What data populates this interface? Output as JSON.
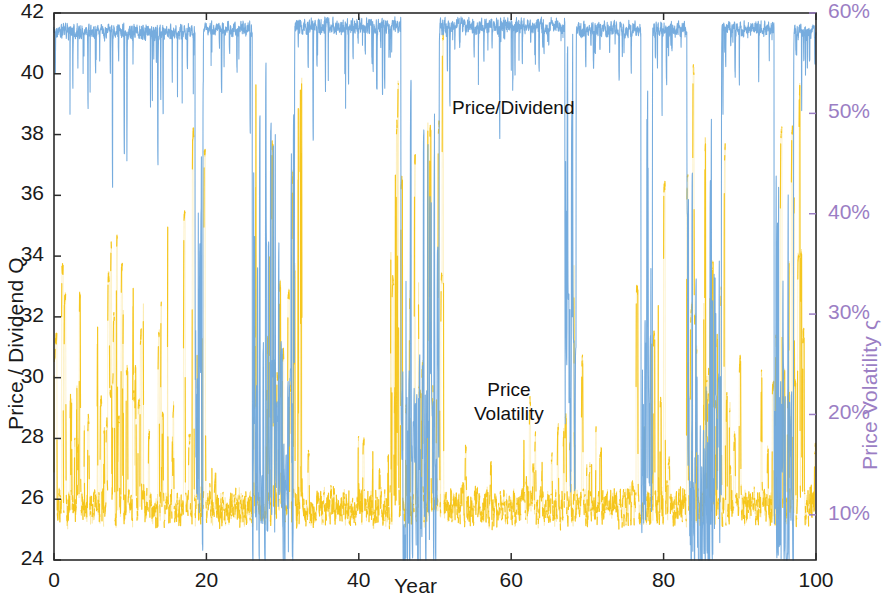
{
  "chart_data": {
    "type": "line",
    "title": "",
    "xlabel": "Year",
    "ylabel": "Price / Dividend Q",
    "ylabel_right": "Price Volatility ς",
    "xlim": [
      0,
      100
    ],
    "ylim": [
      24,
      42
    ],
    "ylim_right": [
      0.055,
      0.6
    ],
    "grid": false,
    "legend": "inline-annotations",
    "xticks": [
      0,
      20,
      40,
      60,
      80,
      100
    ],
    "xticklabels": [
      "0",
      "20",
      "40",
      "60",
      "80",
      "100"
    ],
    "yticks": [
      24,
      26,
      28,
      30,
      32,
      34,
      36,
      38,
      40,
      42
    ],
    "yticklabels": [
      "24",
      "26",
      "28",
      "30",
      "32",
      "34",
      "36",
      "38",
      "40",
      "42"
    ],
    "yticks_right": [
      0.1,
      0.2,
      0.3,
      0.4,
      0.5,
      0.6
    ],
    "yticklabels_right": [
      "10%",
      "20%",
      "30%",
      "40%",
      "50%",
      "60%"
    ],
    "series": [
      {
        "name": "Price/Dividend",
        "axis": "left",
        "color": "#6FA8DC",
        "style": "solid",
        "linewidth": 1,
        "description": "Regime-switching price/dividend ratio Q. Sits near the 41-42 ceiling during calm regimes with frequent sharp downward spikes, and collapses into the 24-30 band during crash regimes.",
        "regimes": [
          {
            "x_start": 0.0,
            "x_end": 18.5,
            "state": "high",
            "level": 41.6,
            "spike_depth_min": 37.5,
            "spike_depth_max": 40.5
          },
          {
            "x_start": 18.5,
            "x_end": 19.5,
            "state": "crash",
            "level": 28.0
          },
          {
            "x_start": 19.5,
            "x_end": 26.0,
            "state": "high",
            "level": 41.7,
            "spike_depth_min": 39.5,
            "spike_depth_max": 41.0
          },
          {
            "x_start": 26.0,
            "x_end": 31.5,
            "state": "crash",
            "level": 27.5
          },
          {
            "x_start": 31.5,
            "x_end": 45.5,
            "state": "high",
            "level": 41.8,
            "spike_depth_min": 38.5,
            "spike_depth_max": 41.0
          },
          {
            "x_start": 45.5,
            "x_end": 50.5,
            "state": "crash",
            "level": 27.0
          },
          {
            "x_start": 50.5,
            "x_end": 67.0,
            "state": "high",
            "level": 41.8,
            "spike_depth_min": 39.0,
            "spike_depth_max": 41.2
          },
          {
            "x_start": 67.0,
            "x_end": 68.5,
            "state": "crash",
            "level": 29.0
          },
          {
            "x_start": 68.5,
            "x_end": 77.0,
            "state": "high",
            "level": 41.7,
            "spike_depth_min": 38.8,
            "spike_depth_max": 41.0
          },
          {
            "x_start": 77.0,
            "x_end": 78.5,
            "state": "crash",
            "level": 28.5
          },
          {
            "x_start": 78.5,
            "x_end": 83.0,
            "state": "high",
            "level": 41.7,
            "spike_depth_min": 39.5,
            "spike_depth_max": 41.0
          },
          {
            "x_start": 83.0,
            "x_end": 87.5,
            "state": "crash",
            "level": 26.5
          },
          {
            "x_start": 87.5,
            "x_end": 94.5,
            "state": "high",
            "level": 41.7,
            "spike_depth_min": 39.2,
            "spike_depth_max": 41.0
          },
          {
            "x_start": 94.5,
            "x_end": 97.0,
            "state": "crash",
            "level": 27.0
          },
          {
            "x_start": 97.0,
            "x_end": 100.0,
            "state": "high",
            "level": 41.6,
            "spike_depth_min": 40.0,
            "spike_depth_max": 41.3
          }
        ]
      },
      {
        "name": "Price Volatility",
        "axis": "right",
        "color": "#F5C518",
        "style": "dotted",
        "linewidth": 1,
        "description": "Instantaneous price volatility. Baseline near 8-11% with dense upward spikes; spikes reach 30-58% during and around crash regimes.",
        "baseline_pct": 9.0,
        "spike_clusters": [
          {
            "x_start": 0.0,
            "x_end": 18.0,
            "peak_pct": 42,
            "density": "high"
          },
          {
            "x_start": 18.0,
            "x_end": 20.0,
            "peak_pct": 52,
            "density": "very-high"
          },
          {
            "x_start": 20.0,
            "x_end": 26.0,
            "peak_pct": 24,
            "density": "low"
          },
          {
            "x_start": 26.0,
            "x_end": 32.5,
            "peak_pct": 58,
            "density": "very-high"
          },
          {
            "x_start": 32.5,
            "x_end": 44.0,
            "peak_pct": 20,
            "density": "low"
          },
          {
            "x_start": 44.0,
            "x_end": 51.0,
            "peak_pct": 58,
            "density": "very-high"
          },
          {
            "x_start": 51.0,
            "x_end": 66.0,
            "peak_pct": 22,
            "density": "low"
          },
          {
            "x_start": 66.0,
            "x_end": 69.5,
            "peak_pct": 40,
            "density": "high"
          },
          {
            "x_start": 69.5,
            "x_end": 76.0,
            "peak_pct": 20,
            "density": "low"
          },
          {
            "x_start": 76.0,
            "x_end": 80.0,
            "peak_pct": 45,
            "density": "high"
          },
          {
            "x_start": 80.0,
            "x_end": 83.0,
            "peak_pct": 24,
            "density": "low"
          },
          {
            "x_start": 83.0,
            "x_end": 88.0,
            "peak_pct": 58,
            "density": "very-high"
          },
          {
            "x_start": 88.0,
            "x_end": 94.0,
            "peak_pct": 30,
            "density": "medium"
          },
          {
            "x_start": 94.0,
            "x_end": 98.5,
            "peak_pct": 56,
            "density": "very-high"
          },
          {
            "x_start": 98.5,
            "x_end": 100.0,
            "peak_pct": 22,
            "density": "medium"
          }
        ]
      }
    ],
    "annotations": [
      {
        "text": "Price/Dividend",
        "x": 52,
        "y": 39.1
      },
      {
        "text": "Price\nVolatility",
        "x": 53,
        "y": 30.2
      }
    ]
  },
  "axes": {
    "left": {
      "label": "Price / Dividend Q",
      "ticklabels": [
        "42",
        "40",
        "38",
        "36",
        "34",
        "32",
        "30",
        "28",
        "26",
        "24"
      ],
      "color": "#1a1a1a"
    },
    "right": {
      "label": "Price Volatility ς",
      "ticklabels": [
        "60%",
        "50%",
        "40%",
        "30%",
        "20%",
        "10%"
      ],
      "color": "#9b7ec4"
    },
    "bottom": {
      "label": "Year",
      "ticklabels": [
        "0",
        "20",
        "40",
        "60",
        "80",
        "100"
      ],
      "color": "#1a1a1a"
    }
  },
  "annotations": {
    "price_dividend": "Price/Dividend",
    "price_volatility": "Price\nVolatility"
  },
  "colors": {
    "price_dividend": "#6FA8DC",
    "price_volatility": "#F5C518",
    "right_axis": "#9b7ec4",
    "axis": "#2b2b2b",
    "background": "#ffffff"
  }
}
